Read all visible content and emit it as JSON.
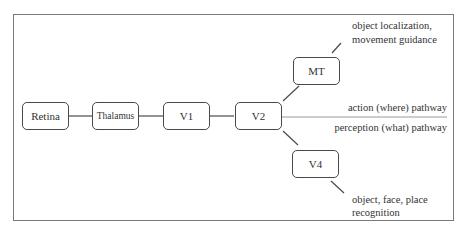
{
  "diagram": {
    "nodes": [
      {
        "id": "retina",
        "label": "Retina"
      },
      {
        "id": "thalamus",
        "label": "Thalamus"
      },
      {
        "id": "v1",
        "label": "V1"
      },
      {
        "id": "v2",
        "label": "V2"
      },
      {
        "id": "mt",
        "label": "MT"
      },
      {
        "id": "v4",
        "label": "V4"
      }
    ],
    "annotations": {
      "mt_line1": "object localization,",
      "mt_line2": "movement guidance",
      "action_pathway": "action (where) pathway",
      "perception_pathway": "perception (what) pathway",
      "v4_line1": "object, face, place",
      "v4_line2": "recognition"
    },
    "edges": [
      [
        "retina",
        "thalamus"
      ],
      [
        "thalamus",
        "v1"
      ],
      [
        "v1",
        "v2"
      ],
      [
        "v2",
        "mt"
      ],
      [
        "v2",
        "v4"
      ]
    ]
  }
}
